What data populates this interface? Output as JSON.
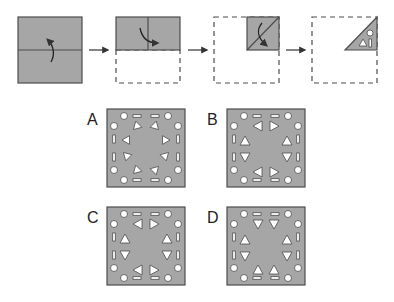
{
  "colors": {
    "paper": "#a6a6a6",
    "outline": "#4d4d4d",
    "hole_fill": "#ffffff",
    "hole_stroke": "#4d4d4d",
    "arrow": "#333333",
    "dashed": "#4d4d4d",
    "label": "#222222"
  },
  "folding_steps": [
    {
      "id": "step-1",
      "description": "full square with horizontal fold line; fold bottom half up"
    },
    {
      "id": "step-2",
      "description": "top half remains with vertical fold line; fold left half to right"
    },
    {
      "id": "step-3",
      "description": "quarter square with diagonal fold line; fold along diagonal"
    },
    {
      "id": "step-4",
      "description": "triangle with punched holes: circle, triangle, rectangle"
    }
  ],
  "punch_holes": [
    "circle",
    "triangle",
    "rectangle"
  ],
  "options": [
    {
      "label": "A",
      "triangle_style": "rotated-diagonal"
    },
    {
      "label": "B",
      "triangle_style": "left-right-up-down"
    },
    {
      "label": "C",
      "triangle_style": "left-right-up-down-alt"
    },
    {
      "label": "D",
      "triangle_style": "up-down-only"
    }
  ]
}
